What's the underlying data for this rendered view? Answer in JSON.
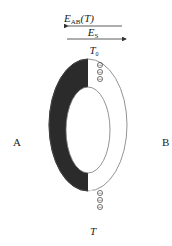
{
  "diagram": {
    "emf_top": {
      "symbol": "E",
      "subscript": "AB",
      "arg": "(T)"
    },
    "emf_bottom": {
      "symbol": "E",
      "subscript": "S"
    },
    "junction_top": {
      "symbol": "T",
      "subscript": "0"
    },
    "junction_bottom": {
      "symbol": "T"
    },
    "conductor_left": "A",
    "conductor_right": "B",
    "positive_charge_glyph": "+",
    "negative_charge_glyph": "−",
    "colors": {
      "conductor_a": "#2b2b2b",
      "conductor_b": "#ffffff",
      "stroke": "#777777"
    }
  }
}
